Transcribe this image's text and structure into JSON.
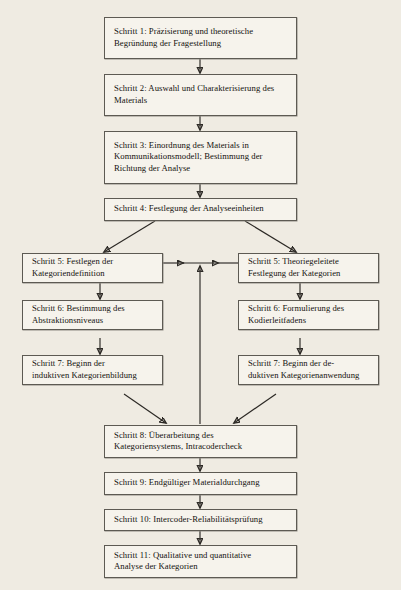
{
  "diagram": {
    "title_semantic": "inhaltsanalytisches-ablaufmodell",
    "language": "de",
    "background_color": "#efebe2",
    "box_fill_color": "#f6f3ec",
    "box_border_color": "#5d5a53",
    "line_color": "#2b2824",
    "nodes": [
      {
        "id": "schritt-1",
        "lines": [
          "Schritt 1: Präzisierung und  theoretische",
          "Begründung der Fragestellung"
        ]
      },
      {
        "id": "schritt-2",
        "lines": [
          "Schritt 2: Auswahl und Charakterisierung des",
          "Materials"
        ]
      },
      {
        "id": "schritt-3",
        "lines": [
          "Schritt 3: Einordnung des Materials in",
          "Kommunikationsmodell; Bestimmung der",
          "Richtung der Analyse"
        ]
      },
      {
        "id": "schritt-4",
        "lines": [
          "Schritt 4: Festlegung der Analyseeinheiten"
        ]
      },
      {
        "id": "schritt-5-induktiv",
        "lines": [
          "Schritt 5: Festlegen der",
          "Kategoriendefinition"
        ]
      },
      {
        "id": "schritt-5-deduktiv",
        "lines": [
          "Schritt 5: Theoriegeleitete",
          "Festlegung der Kategorien"
        ]
      },
      {
        "id": "schritt-6-induktiv",
        "lines": [
          "Schritt 6: Bestimmung des",
          "Abstraktionsniveaus"
        ]
      },
      {
        "id": "schritt-6-deduktiv",
        "lines": [
          "Schritt 6: Formulierung des",
          "Kodierleitfadens"
        ]
      },
      {
        "id": "schritt-7-induktiv",
        "lines": [
          "Schritt 7: Beginn der",
          "induktiven Kategorienbildung"
        ]
      },
      {
        "id": "schritt-7-deduktiv",
        "lines": [
          "Schritt 7: Beginn der de-",
          "duktiven Kategorienanwendung"
        ]
      },
      {
        "id": "schritt-8",
        "lines": [
          "Schritt 8: Überarbeitung des",
          "Kategoriensystems, Intracodercheck"
        ]
      },
      {
        "id": "schritt-9",
        "lines": [
          "Schritt 9: Endgültiger Materialdurchgang"
        ]
      },
      {
        "id": "schritt-10",
        "lines": [
          "Schritt 10: Intercoder-Reliabilitätsprüfung"
        ]
      },
      {
        "id": "schritt-11",
        "lines": [
          "Schritt 11: Qualitative und quantitative",
          "Analyse der Kategorien"
        ]
      }
    ]
  }
}
